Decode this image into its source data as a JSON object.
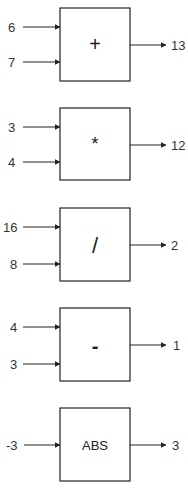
{
  "diagram": {
    "blocks": [
      {
        "operator": "+",
        "inputs": [
          "6",
          "7"
        ],
        "output": "13"
      },
      {
        "operator": "*",
        "inputs": [
          "3",
          "4"
        ],
        "output": "12"
      },
      {
        "operator": "/",
        "inputs": [
          "16",
          "8"
        ],
        "output": "2"
      },
      {
        "operator": "-",
        "inputs": [
          "4",
          "3"
        ],
        "output": "1"
      },
      {
        "operator": "ABS",
        "inputs": [
          "-3"
        ],
        "output": "3"
      }
    ]
  }
}
